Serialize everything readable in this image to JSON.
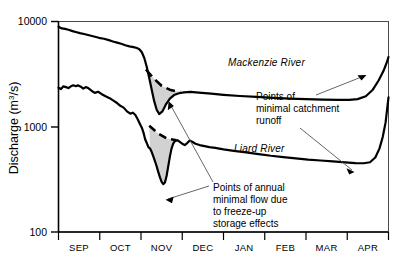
{
  "chart_data": {
    "type": "line",
    "title": "",
    "xlabel": "",
    "ylabel": "Discharge  (m3/s)",
    "ylabel_base": "Discharge  (m",
    "ylabel_sup": "3",
    "ylabel_tail": "/s)",
    "yscale": "log",
    "ylim": [
      100,
      10000
    ],
    "ytick_labels": [
      "10000",
      "1000",
      "100"
    ],
    "ytick_values": [
      10000,
      1000,
      100
    ],
    "grid": false,
    "legend_position": "inline-labels",
    "categories": [
      "SEP",
      "OCT",
      "NOV",
      "DEC",
      "JAN",
      "FEB",
      "MAR",
      "APR"
    ],
    "xlim_months": [
      0,
      8
    ],
    "series": [
      {
        "name": "Mackenzie River",
        "label": "Mackenzie River",
        "style": "solid-thick",
        "points": [
          [
            0.0,
            8900
          ],
          [
            0.08,
            8600
          ],
          [
            0.16,
            8500
          ],
          [
            0.24,
            8350
          ],
          [
            0.34,
            8100
          ],
          [
            0.44,
            7900
          ],
          [
            0.52,
            7750
          ],
          [
            0.62,
            7600
          ],
          [
            0.74,
            7400
          ],
          [
            0.86,
            7200
          ],
          [
            0.98,
            7000
          ],
          [
            1.1,
            6850
          ],
          [
            1.22,
            6650
          ],
          [
            1.32,
            6450
          ],
          [
            1.42,
            6300
          ],
          [
            1.52,
            6150
          ],
          [
            1.62,
            5950
          ],
          [
            1.72,
            5800
          ],
          [
            1.82,
            5700
          ],
          [
            1.9,
            5600
          ],
          [
            1.96,
            5450
          ],
          [
            2.02,
            5100
          ],
          [
            2.08,
            4500
          ],
          [
            2.14,
            3700
          ],
          [
            2.2,
            2900
          ],
          [
            2.26,
            2250
          ],
          [
            2.32,
            1750
          ],
          [
            2.38,
            1450
          ],
          [
            2.44,
            1320
          ],
          [
            2.52,
            1400
          ],
          [
            2.6,
            1620
          ],
          [
            2.7,
            1850
          ],
          [
            2.8,
            2000
          ],
          [
            2.92,
            2080
          ],
          [
            3.04,
            2120
          ],
          [
            3.2,
            2140
          ],
          [
            3.4,
            2110
          ],
          [
            3.7,
            2060
          ],
          [
            4.0,
            2010
          ],
          [
            4.4,
            1960
          ],
          [
            4.8,
            1920
          ],
          [
            5.2,
            1880
          ],
          [
            5.6,
            1850
          ],
          [
            6.0,
            1830
          ],
          [
            6.4,
            1810
          ],
          [
            6.8,
            1800
          ],
          [
            7.05,
            1800
          ],
          [
            7.25,
            1830
          ],
          [
            7.45,
            1950
          ],
          [
            7.62,
            2250
          ],
          [
            7.76,
            2750
          ],
          [
            7.88,
            3400
          ],
          [
            7.96,
            4100
          ],
          [
            8.0,
            4600
          ]
        ],
        "trend_dashed": [
          [
            2.12,
            3500
          ],
          [
            2.3,
            2900
          ],
          [
            2.5,
            2450
          ],
          [
            2.72,
            2230
          ],
          [
            2.95,
            2140
          ]
        ]
      },
      {
        "name": "Liard River",
        "label": "Liard River",
        "style": "solid-thick",
        "points": [
          [
            0.0,
            2350
          ],
          [
            0.06,
            2280
          ],
          [
            0.12,
            2420
          ],
          [
            0.18,
            2380
          ],
          [
            0.24,
            2330
          ],
          [
            0.3,
            2420
          ],
          [
            0.36,
            2480
          ],
          [
            0.42,
            2430
          ],
          [
            0.48,
            2470
          ],
          [
            0.54,
            2400
          ],
          [
            0.6,
            2300
          ],
          [
            0.66,
            2380
          ],
          [
            0.72,
            2330
          ],
          [
            0.8,
            2200
          ],
          [
            0.88,
            2100
          ],
          [
            0.96,
            2150
          ],
          [
            1.04,
            2050
          ],
          [
            1.14,
            1950
          ],
          [
            1.24,
            1870
          ],
          [
            1.34,
            1760
          ],
          [
            1.42,
            1680
          ],
          [
            1.5,
            1580
          ],
          [
            1.58,
            1520
          ],
          [
            1.66,
            1400
          ],
          [
            1.74,
            1330
          ],
          [
            1.8,
            1360
          ],
          [
            1.86,
            1300
          ],
          [
            1.92,
            1180
          ],
          [
            1.98,
            1050
          ],
          [
            2.02,
            980
          ],
          [
            2.06,
            880
          ],
          [
            2.1,
            760
          ],
          [
            2.14,
            700
          ],
          [
            2.18,
            640
          ],
          [
            2.22,
            620
          ],
          [
            2.26,
            575
          ],
          [
            2.3,
            520
          ],
          [
            2.34,
            470
          ],
          [
            2.38,
            420
          ],
          [
            2.42,
            370
          ],
          [
            2.46,
            330
          ],
          [
            2.5,
            300
          ],
          [
            2.54,
            285
          ],
          [
            2.58,
            295
          ],
          [
            2.62,
            340
          ],
          [
            2.66,
            420
          ],
          [
            2.7,
            520
          ],
          [
            2.74,
            620
          ],
          [
            2.78,
            690
          ],
          [
            2.82,
            730
          ],
          [
            2.88,
            745
          ],
          [
            2.94,
            720
          ],
          [
            3.0,
            690
          ],
          [
            3.06,
            670
          ],
          [
            3.12,
            700
          ],
          [
            3.18,
            740
          ],
          [
            3.24,
            720
          ],
          [
            3.32,
            690
          ],
          [
            3.42,
            670
          ],
          [
            3.54,
            655
          ],
          [
            3.66,
            640
          ],
          [
            3.8,
            630
          ],
          [
            4.0,
            610
          ],
          [
            4.25,
            590
          ],
          [
            4.55,
            570
          ],
          [
            4.85,
            550
          ],
          [
            5.15,
            530
          ],
          [
            5.45,
            515
          ],
          [
            5.75,
            500
          ],
          [
            6.05,
            487
          ],
          [
            6.35,
            478
          ],
          [
            6.65,
            468
          ],
          [
            6.95,
            458
          ],
          [
            7.2,
            452
          ],
          [
            7.4,
            450
          ],
          [
            7.55,
            460
          ],
          [
            7.68,
            510
          ],
          [
            7.78,
            620
          ],
          [
            7.86,
            800
          ],
          [
            7.93,
            1100
          ],
          [
            7.97,
            1500
          ],
          [
            8.0,
            1900
          ]
        ],
        "trend_dashed": [
          [
            2.2,
            1020
          ],
          [
            2.42,
            860
          ],
          [
            2.64,
            770
          ],
          [
            2.86,
            745
          ]
        ]
      }
    ],
    "annotations": [
      {
        "id": "minimal-catchment-runoff",
        "lines": [
          "Points of",
          "minimal catchment",
          "runoff"
        ],
        "text": "Points of minimal catchment runoff",
        "arrows": 2
      },
      {
        "id": "minimal-flow-freeze-up",
        "lines": [
          "Points of annual",
          "minimal flow due",
          "to freeze-up",
          "storage effects"
        ],
        "text": "Points of annual minimal flow due to freeze-up storage effects",
        "arrows": 2
      }
    ],
    "shaded_regions": [
      {
        "series": "Mackenzie River",
        "fill": "#d0d0d0",
        "description": "freeze-up deficit wedge"
      },
      {
        "series": "Liard River",
        "fill": "#d0d0d0",
        "description": "freeze-up deficit wedge"
      }
    ],
    "colors": {
      "line": "#000000",
      "shade": "#d0d0d0",
      "axis": "#000000",
      "background": "#ffffff"
    }
  }
}
